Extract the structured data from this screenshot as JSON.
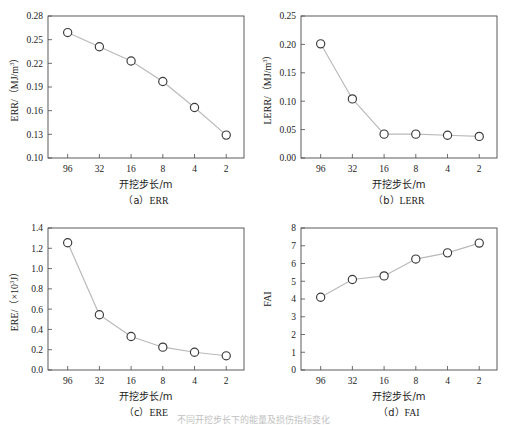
{
  "figure": {
    "footer_caption": "不同开挖步长下的能量及损伤指标变化",
    "x_axis_title": "开挖步长/m",
    "categories": [
      "96",
      "32",
      "16",
      "8",
      "4",
      "2"
    ]
  },
  "chart_data": [
    {
      "id": "a",
      "type": "line",
      "title": "",
      "caption": "（a）ERR",
      "caption_prefix": "（a）",
      "caption_name": "ERR",
      "xlabel": "开挖步长/m",
      "ylabel_main": "ERR/（MJ/m",
      "ylabel_sup": "3",
      "ylabel_tail": "）",
      "ylabel_plain": "ERR/(MJ/m3)",
      "categories": [
        "96",
        "32",
        "16",
        "8",
        "4",
        "2"
      ],
      "values": [
        0.259,
        0.241,
        0.223,
        0.197,
        0.164,
        0.129
      ],
      "yticks": [
        "0.10",
        "0.13",
        "0.16",
        "0.19",
        "0.22",
        "0.25",
        "0.28"
      ],
      "ytick_values": [
        0.1,
        0.13,
        0.16,
        0.19,
        0.22,
        0.25,
        0.28
      ],
      "ylim": [
        0.1,
        0.28
      ],
      "grid": false,
      "legend": "none",
      "marker": "open-circle"
    },
    {
      "id": "b",
      "type": "line",
      "title": "",
      "caption": "（b）LERR",
      "caption_prefix": "（b）",
      "caption_name": "LERR",
      "xlabel": "开挖步长/m",
      "ylabel_main": "LERR/（MJ/m",
      "ylabel_sup": "3",
      "ylabel_tail": "）",
      "ylabel_plain": "LERR/(MJ/m3)",
      "categories": [
        "96",
        "32",
        "16",
        "8",
        "4",
        "2"
      ],
      "values": [
        0.201,
        0.104,
        0.042,
        0.042,
        0.04,
        0.038
      ],
      "yticks": [
        "0.00",
        "0.05",
        "0.10",
        "0.15",
        "0.20",
        "0.25"
      ],
      "ytick_values": [
        0.0,
        0.05,
        0.1,
        0.15,
        0.2,
        0.25
      ],
      "ylim": [
        0.0,
        0.25
      ],
      "grid": false,
      "legend": "none",
      "marker": "open-circle"
    },
    {
      "id": "c",
      "type": "line",
      "title": "",
      "caption": "（c）ERE",
      "caption_prefix": "（c）",
      "caption_name": "ERE",
      "xlabel": "开挖步长/m",
      "ylabel_main": "ERE/（×10",
      "ylabel_sup": "3",
      "ylabel_tail": "J）",
      "ylabel_plain": "ERE/(×103J)",
      "categories": [
        "96",
        "32",
        "16",
        "8",
        "4",
        "2"
      ],
      "values": [
        1.255,
        0.545,
        0.33,
        0.225,
        0.175,
        0.14
      ],
      "yticks": [
        "0.0",
        "0.2",
        "0.4",
        "0.6",
        "0.8",
        "1.0",
        "1.2",
        "1.4"
      ],
      "ytick_values": [
        0.0,
        0.2,
        0.4,
        0.6,
        0.8,
        1.0,
        1.2,
        1.4
      ],
      "ylim": [
        0.0,
        1.4
      ],
      "grid": false,
      "legend": "none",
      "marker": "open-circle"
    },
    {
      "id": "d",
      "type": "line",
      "title": "",
      "caption": "（d）FAI",
      "caption_prefix": "（d）",
      "caption_name": "FAI",
      "xlabel": "开挖步长/m",
      "ylabel_main": "FAI",
      "ylabel_sup": "",
      "ylabel_tail": "",
      "ylabel_plain": "FAI",
      "categories": [
        "96",
        "32",
        "16",
        "8",
        "4",
        "2"
      ],
      "values": [
        4.1,
        5.1,
        5.3,
        6.25,
        6.6,
        7.15
      ],
      "yticks": [
        "0",
        "1",
        "2",
        "3",
        "4",
        "5",
        "6",
        "7",
        "8"
      ],
      "ytick_values": [
        0,
        1,
        2,
        3,
        4,
        5,
        6,
        7,
        8
      ],
      "ylim": [
        0,
        8
      ],
      "grid": false,
      "legend": "none",
      "marker": "open-circle"
    }
  ],
  "colors": {
    "axis": "#4a4a4a",
    "line": "#b9b9b9",
    "marker_stroke": "#3a3a3a",
    "marker_fill": "#ffffff",
    "text": "#1c1c1c"
  }
}
